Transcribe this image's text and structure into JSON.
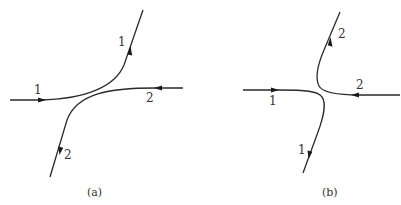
{
  "figure": {
    "panels": [
      {
        "id": "a",
        "caption": "(a)",
        "description": "Two trajectories approach and deflect away from each other without crossing",
        "curves": [
          {
            "label": "1",
            "in_label": "1",
            "out_label": "1",
            "direction": "enters from left, exits upward to the right"
          },
          {
            "label": "2",
            "in_label": "2",
            "out_label": "2",
            "direction": "enters from right, exits downward to the left"
          }
        ]
      },
      {
        "id": "b",
        "caption": "(b)",
        "description": "Two trajectories approach and each turns sharply, exchanging directions",
        "curves": [
          {
            "label": "1",
            "in_label": "1",
            "out_label": "1",
            "direction": "enters from left, exits downward"
          },
          {
            "label": "2",
            "in_label": "2",
            "out_label": "2",
            "direction": "enters from right, exits upward"
          }
        ]
      }
    ],
    "colors": {
      "line": "#2a2a2a",
      "text": "#333333",
      "background": "#ffffff"
    }
  }
}
